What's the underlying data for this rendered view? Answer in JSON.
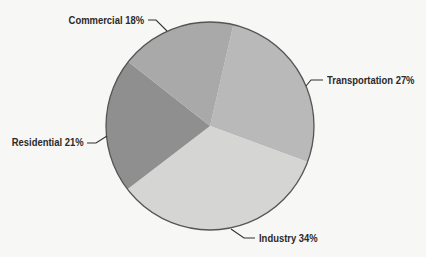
{
  "chart_data": {
    "type": "pie",
    "title": "",
    "categories": [
      "Transportation",
      "Industry",
      "Residential",
      "Commercial"
    ],
    "values": [
      27,
      34,
      21,
      18
    ],
    "unit": "%",
    "labels": [
      "Transportation 27%",
      "Industry 34%",
      "Residential 21%",
      "Commercial 18%"
    ],
    "colors": [
      "#b9b9b9",
      "#d5d5d3",
      "#8f8f8f",
      "#a9a9a9"
    ],
    "start_angle_deg_clockwise_from_top": 13,
    "legend": "none (direct labels with leader lines)",
    "outline_color": "#555555",
    "background_color": "#f7f7f5"
  },
  "labels": {
    "commercial": "Commercial 18%",
    "transportation": "Transportation 27%",
    "residential": "Residential 21%",
    "industry": "Industry 34%"
  }
}
